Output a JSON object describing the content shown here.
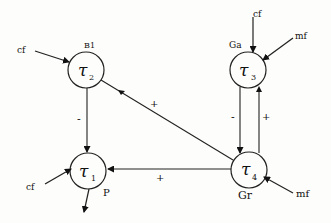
{
  "diagram": {
    "nodes": [
      {
        "id": "tau2",
        "symbol": "τ",
        "subscript": "2",
        "tag": "B1",
        "cx": 86,
        "cy": 70
      },
      {
        "id": "tau1",
        "symbol": "τ",
        "subscript": "1",
        "tag": "P",
        "cx": 88,
        "cy": 171
      },
      {
        "id": "tau3",
        "symbol": "τ",
        "subscript": "3",
        "tag": "Ga",
        "cx": 248,
        "cy": 70
      },
      {
        "id": "tau4",
        "symbol": "τ",
        "subscript": "4",
        "tag": "Gr",
        "cx": 249,
        "cy": 170
      }
    ],
    "edges": [
      {
        "from": "tau2",
        "to": "tau1",
        "sign": "-"
      },
      {
        "from": "tau4",
        "to": "tau2",
        "sign": "+"
      },
      {
        "from": "tau4",
        "to": "tau1",
        "sign": "+"
      },
      {
        "from": "tau3",
        "to": "tau4",
        "sign": "-"
      },
      {
        "from": "tau4",
        "to": "tau3",
        "sign": "+"
      }
    ],
    "inputs": [
      {
        "label": "cf",
        "to": "tau2"
      },
      {
        "label": "cf",
        "to": "tau1"
      },
      {
        "label": "cf",
        "to": "tau3"
      },
      {
        "label": "mf",
        "to": "tau3"
      },
      {
        "label": "mf",
        "to": "tau4"
      }
    ],
    "outputs": [
      {
        "from": "tau1"
      }
    ]
  }
}
